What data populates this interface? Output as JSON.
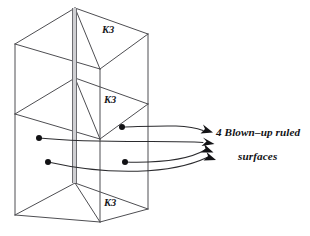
{
  "figure": {
    "background_color": "#ffffff",
    "line_color": "#4e4e52",
    "accent_color": "#131316",
    "labels": {
      "k3_top": "K3",
      "k3_middle": "K3",
      "k3_bottom": "K3"
    },
    "caption": {
      "line_1": "4 Blown–up ruled",
      "line_2": "surfaces"
    },
    "label_positions": {
      "k3_top": {
        "x": 102,
        "y": 33
      },
      "k3_middle": {
        "x": 104,
        "y": 103
      },
      "k3_bottom": {
        "x": 104,
        "y": 206
      }
    },
    "geometry": {
      "box": {
        "left_x": 15,
        "right_x": 148,
        "apex_x": 75,
        "front_x": 100,
        "top_apex_y": 8,
        "top_left_y": 44,
        "top_right_y": 34,
        "top_front_y": 69,
        "mid_apex_y": 78,
        "mid_left_y": 114,
        "mid_right_y": 104,
        "mid_front_y": 139,
        "bot_apex_y": 183,
        "bot_left_y": 215,
        "bot_right_y": 209,
        "bot_front_y": 222
      },
      "spine": {
        "x_left": 72,
        "x_right": 77,
        "y_top": 8,
        "y_bottom": 183
      }
    },
    "nodes": [
      {
        "name": "node-right-upper",
        "x": 122,
        "y": 127,
        "r": 3.0
      },
      {
        "name": "node-left-upper",
        "x": 39,
        "y": 138,
        "r": 3.0
      },
      {
        "name": "node-right-lower",
        "x": 125,
        "y": 162,
        "r": 3.0
      },
      {
        "name": "node-left-lower",
        "x": 48,
        "y": 162,
        "r": 3.0
      }
    ],
    "connectors": [
      {
        "name": "connector-1",
        "from_x": 122,
        "from_y": 127,
        "to_x": 204,
        "to_y": 131
      },
      {
        "name": "connector-2",
        "from_x": 39,
        "from_y": 138,
        "to_x": 204,
        "to_y": 143
      },
      {
        "name": "connector-3",
        "from_x": 125,
        "from_y": 162,
        "to_x": 206,
        "to_y": 150
      },
      {
        "name": "connector-4",
        "from_x": 48,
        "from_y": 162,
        "to_x": 208,
        "to_y": 158
      }
    ],
    "arrow_count": 4
  }
}
